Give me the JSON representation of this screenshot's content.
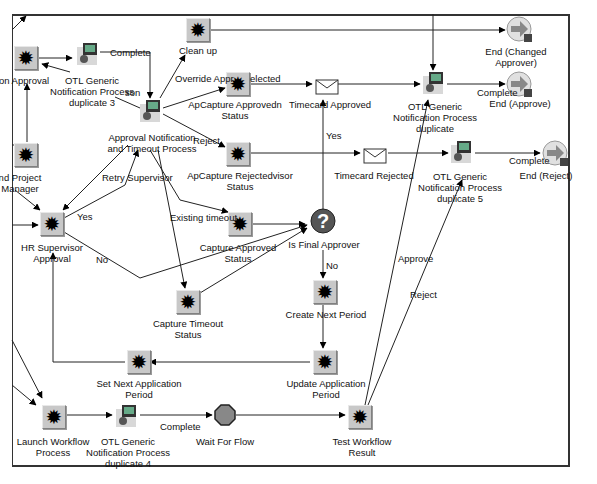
{
  "diagram": {
    "nodes": {
      "son_approval": {
        "label": "on Approval",
        "type": "function"
      },
      "otl_dup3": {
        "label1": "OTL Generic",
        "label2": "Notification Process",
        "label3": "duplicate 3",
        "type": "process"
      },
      "clean_up": {
        "label": "Clean up",
        "type": "function"
      },
      "apcapture_approved": {
        "label1": "ApCapture Approvedn",
        "label2": "Status",
        "type": "function"
      },
      "timecard_approved": {
        "label": "Timecard Approved",
        "type": "notification"
      },
      "otl_dup": {
        "label1": "OTL Generic",
        "label2": "Notification Process",
        "label3": "duplicate",
        "type": "process"
      },
      "end_changed": {
        "label1": "End (Changed",
        "label2": "Approver)",
        "type": "end"
      },
      "end_approve": {
        "label": "End (Approve)",
        "type": "end"
      },
      "approval_notif": {
        "label1": "Approval Notification",
        "label2": "and Timeout Process",
        "type": "process"
      },
      "project_manager": {
        "label1": "nd Project",
        "label2": "Manager",
        "type": "function"
      },
      "apcapture_rejected": {
        "label1": "ApCapture Rejectedvisor",
        "label2": "Status",
        "type": "function"
      },
      "timecard_rejected": {
        "label": "Timecard Rejected",
        "type": "notification"
      },
      "otl_dup5": {
        "label1": "OTL Generic",
        "label2": "Notification Process",
        "label3": "duplicate 5",
        "type": "process"
      },
      "end_reject": {
        "label": "End (Reject)",
        "type": "end"
      },
      "hr_supervisor": {
        "label1": "HR Supervisor",
        "label2": "Approval",
        "type": "function"
      },
      "capture_approved": {
        "label1": "Capture Approved",
        "label2": "Status",
        "type": "function"
      },
      "is_final_approver": {
        "label": "Is Final Approver",
        "type": "decision"
      },
      "capture_timeout": {
        "label1": "Capture Timeout",
        "label2": "Status",
        "type": "function"
      },
      "create_next_period": {
        "label": "Create Next Period",
        "type": "function"
      },
      "set_next_app_period": {
        "label1": "Set Next Application",
        "label2": "Period",
        "type": "function"
      },
      "update_app_period": {
        "label1": "Update Application",
        "label2": "Period",
        "type": "function"
      },
      "launch_workflow": {
        "label1": "Launch Workflow",
        "label2": "Process",
        "type": "function"
      },
      "otl_dup4": {
        "label1": "OTL Generic",
        "label2": "Notification Process",
        "label3": "duplicate 4",
        "type": "process"
      },
      "wait_for_flow": {
        "label": "Wait For Flow",
        "type": "wait"
      },
      "test_workflow": {
        "label1": "Test Workflow",
        "label2": "Result",
        "type": "function"
      }
    },
    "edge_labels": {
      "complete_top": "Complete",
      "override": "Override Appr",
      "rejected": "elected",
      "son": "son",
      "reject_mid": "Reject",
      "retry_supervisor": "Retry Supervisor",
      "yes_hr": "Yes",
      "no_hr": "No",
      "existing_timeout": "Existing timeout",
      "yes_final": "Yes",
      "no_final": "No",
      "complete_approve": "Complete",
      "complete_reject": "Complete",
      "approve": "Approve",
      "reject_test": "Reject",
      "complete_bottom": "Complete"
    },
    "glyphs": {
      "gear": "✹",
      "question": "?"
    }
  }
}
